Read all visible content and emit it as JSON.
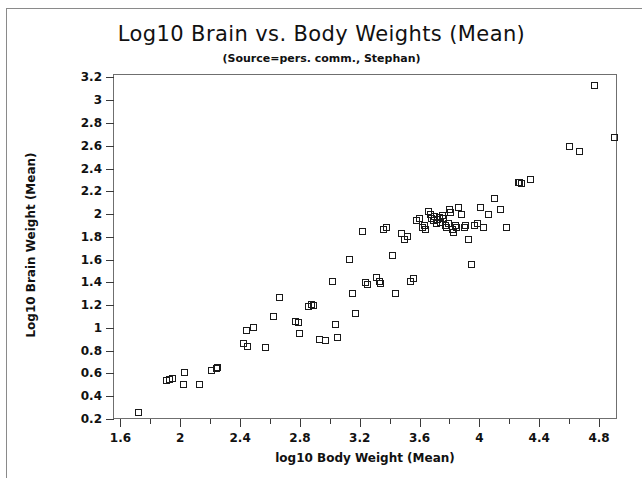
{
  "chart_data": {
    "type": "scatter",
    "title": "Log10 Brain vs. Body Weights (Mean)",
    "subtitle": "(Source=pers. comm., Stephan)",
    "xlabel": "log10 Body Weight (Mean)",
    "ylabel": "Log10 Brain Weight (Mean)",
    "xlim": [
      1.55,
      4.92
    ],
    "ylim": [
      0.2,
      3.23
    ],
    "grid": false,
    "legend": null,
    "marker": "open-square",
    "marker_color": "#1a1a1a",
    "xticks": [
      1.6,
      1.8,
      2.0,
      2.2,
      2.4,
      2.6,
      2.8,
      3.0,
      3.2,
      3.4,
      3.6,
      3.8,
      4.0,
      4.2,
      4.4,
      4.6,
      4.8
    ],
    "xticklabels": [
      "1.6",
      "",
      "2",
      "",
      "2.4",
      "",
      "2.8",
      "",
      "3.2",
      "",
      "3.6",
      "",
      "4",
      "",
      "4.4",
      "",
      "4.8"
    ],
    "yticks": [
      0.2,
      0.4,
      0.6,
      0.8,
      1.0,
      1.2,
      1.4,
      1.6,
      1.8,
      2.0,
      2.2,
      2.4,
      2.6,
      2.8,
      3.0,
      3.2
    ],
    "yticklabels": [
      "0.2",
      "0.4",
      "0.6",
      "0.8",
      "1",
      "1.2",
      "1.4",
      "1.6",
      "1.8",
      "2",
      "2.2",
      "2.4",
      "2.6",
      "2.8",
      "3",
      "3.2"
    ],
    "points": [
      [
        1.72,
        0.26
      ],
      [
        1.91,
        0.54
      ],
      [
        1.95,
        0.56
      ],
      [
        1.93,
        0.55
      ],
      [
        2.03,
        0.61
      ],
      [
        2.02,
        0.5
      ],
      [
        2.13,
        0.5
      ],
      [
        2.21,
        0.63
      ],
      [
        2.25,
        0.65
      ],
      [
        2.24,
        0.64
      ],
      [
        2.42,
        0.86
      ],
      [
        2.45,
        0.84
      ],
      [
        2.44,
        0.98
      ],
      [
        2.49,
        1.0
      ],
      [
        2.57,
        0.83
      ],
      [
        2.62,
        1.1
      ],
      [
        2.66,
        1.27
      ],
      [
        2.77,
        1.06
      ],
      [
        2.79,
        1.05
      ],
      [
        2.8,
        0.95
      ],
      [
        2.86,
        1.19
      ],
      [
        2.88,
        1.21
      ],
      [
        2.89,
        1.2
      ],
      [
        2.93,
        0.9
      ],
      [
        2.97,
        0.89
      ],
      [
        3.02,
        1.41
      ],
      [
        3.04,
        1.03
      ],
      [
        3.05,
        0.92
      ],
      [
        3.13,
        1.6
      ],
      [
        3.15,
        1.3
      ],
      [
        3.17,
        1.13
      ],
      [
        3.22,
        1.85
      ],
      [
        3.24,
        1.4
      ],
      [
        3.25,
        1.38
      ],
      [
        3.31,
        1.44
      ],
      [
        3.33,
        1.41
      ],
      [
        3.34,
        1.39
      ],
      [
        3.36,
        1.86
      ],
      [
        3.38,
        1.88
      ],
      [
        3.42,
        1.64
      ],
      [
        3.44,
        1.3
      ],
      [
        3.48,
        1.83
      ],
      [
        3.5,
        1.78
      ],
      [
        3.52,
        1.8
      ],
      [
        3.54,
        1.41
      ],
      [
        3.56,
        1.43
      ],
      [
        3.58,
        1.94
      ],
      [
        3.6,
        1.96
      ],
      [
        3.62,
        1.88
      ],
      [
        3.63,
        1.9
      ],
      [
        3.64,
        1.86
      ],
      [
        3.66,
        2.02
      ],
      [
        3.67,
        2.0
      ],
      [
        3.68,
        1.96
      ],
      [
        3.69,
        1.94
      ],
      [
        3.7,
        1.98
      ],
      [
        3.71,
        1.92
      ],
      [
        3.72,
        1.95
      ],
      [
        3.73,
        1.97
      ],
      [
        3.74,
        1.93
      ],
      [
        3.75,
        1.99
      ],
      [
        3.76,
        1.96
      ],
      [
        3.77,
        1.9
      ],
      [
        3.78,
        1.88
      ],
      [
        3.79,
        1.92
      ],
      [
        3.8,
        2.04
      ],
      [
        3.81,
        2.01
      ],
      [
        3.82,
        1.86
      ],
      [
        3.83,
        1.84
      ],
      [
        3.84,
        1.9
      ],
      [
        3.85,
        1.88
      ],
      [
        3.86,
        2.06
      ],
      [
        3.88,
        2.0
      ],
      [
        3.9,
        1.88
      ],
      [
        3.91,
        1.9
      ],
      [
        3.93,
        1.78
      ],
      [
        3.95,
        1.56
      ],
      [
        3.97,
        1.9
      ],
      [
        3.99,
        1.92
      ],
      [
        4.01,
        2.06
      ],
      [
        4.03,
        1.88
      ],
      [
        4.06,
        2.0
      ],
      [
        4.1,
        2.14
      ],
      [
        4.14,
        2.04
      ],
      [
        4.18,
        1.88
      ],
      [
        4.26,
        2.28
      ],
      [
        4.28,
        2.27
      ],
      [
        4.27,
        2.28
      ],
      [
        4.34,
        2.3
      ],
      [
        4.6,
        2.59
      ],
      [
        4.67,
        2.55
      ],
      [
        4.77,
        3.13
      ],
      [
        4.9,
        2.67
      ]
    ],
    "n_points": 94
  }
}
